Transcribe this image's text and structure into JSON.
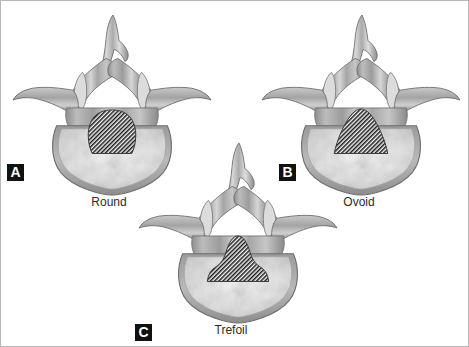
{
  "figure": {
    "background_color": "#ffffff",
    "border_color": "#b8b8b8",
    "render_style": "grayscale medical illustration",
    "canal_fill": "diagonal black hatching",
    "bone_color": "#a8a8a8",
    "bone_highlight_color": "#e2e2e2",
    "bone_shadow_color": "#6f6f6f",
    "body_interior_color": "#ededed",
    "label_badge_bg": "#111111",
    "label_badge_fg": "#ffffff"
  },
  "panels": [
    {
      "id": "a",
      "label": "A",
      "caption": "Round",
      "canal_shape": "round",
      "structures": [
        "spinous process",
        "lamina",
        "superior articular process",
        "transverse process",
        "pedicle",
        "vertebral body",
        "spinal canal"
      ]
    },
    {
      "id": "b",
      "label": "B",
      "caption": "Ovoid",
      "canal_shape": "ovoid",
      "structures": [
        "spinous process",
        "lamina",
        "superior articular process",
        "transverse process",
        "pedicle",
        "vertebral body",
        "spinal canal"
      ]
    },
    {
      "id": "c",
      "label": "C",
      "caption": "Trefoil",
      "canal_shape": "trefoil",
      "structures": [
        "spinous process",
        "lamina",
        "superior articular process",
        "transverse process",
        "pedicle",
        "vertebral body",
        "spinal canal"
      ]
    }
  ]
}
